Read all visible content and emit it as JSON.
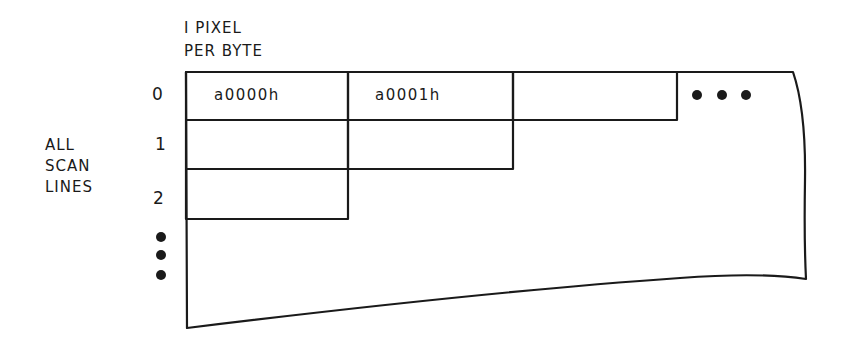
{
  "diagram": {
    "header_label": {
      "line1": "I PIXEL",
      "line2": "PER BYTE"
    },
    "side_label": {
      "line1": "ALL",
      "line2": "SCAN",
      "line3": "LINES"
    },
    "row_labels": [
      "0",
      "1",
      "2"
    ],
    "cells": [
      {
        "row": 0,
        "col": 0,
        "text": "a0000h"
      },
      {
        "row": 0,
        "col": 1,
        "text": "a0001h"
      },
      {
        "row": 0,
        "col": 2,
        "text": ""
      }
    ],
    "continuation": {
      "horizontal": "• • •",
      "vertical": "•\n•\n•"
    },
    "colors": {
      "ink": "#1a1a1a",
      "background": "#ffffff"
    }
  }
}
